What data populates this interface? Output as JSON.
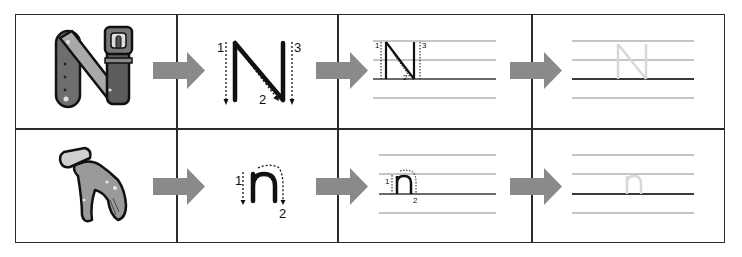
{
  "worksheet": {
    "letter_upper": "N",
    "letter_lower": "n",
    "colors": {
      "grid": "#2b2b2b",
      "arrow": "#8a8a8a",
      "stroke": "#111111",
      "guide_line": "#8c8c8c",
      "baseline": "#3a3a3a",
      "trace_letter": "#d8d8d8",
      "picture_fill": "#9a9a9a"
    },
    "rows": [
      {
        "picture": "belt-shaped-letter-n",
        "stroke_numbers": [
          "1",
          "2",
          "3"
        ],
        "trace_letter": "N"
      },
      {
        "picture": "glove",
        "stroke_numbers": [
          "1",
          "2"
        ],
        "trace_letter": "n"
      }
    ]
  }
}
